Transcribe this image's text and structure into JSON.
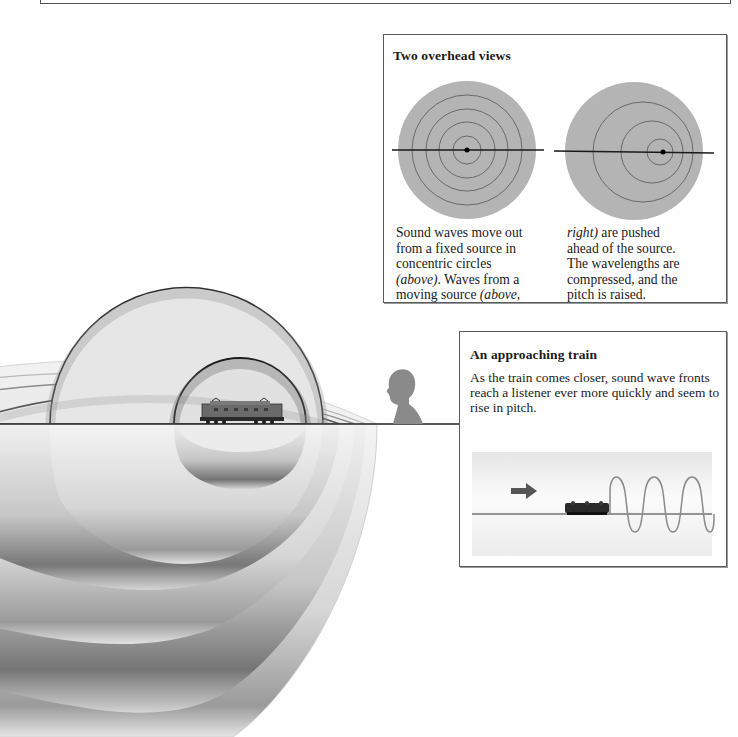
{
  "page": {
    "background": "#ffffff"
  },
  "main_illustration": {
    "description": "Expanding sound wave fronts from a moving train, bunched toward the listener",
    "icons": {
      "train": "locomotive-icon",
      "listener": "person-silhouette-icon"
    },
    "ground_line_y": 424
  },
  "overhead_panel": {
    "title": "Two overhead views",
    "left_caption": {
      "line1": "Sound waves move out",
      "line2": "from a fixed source in",
      "line3": "concentric circles",
      "line4_italic": "(above)",
      "line4_rest": ". Waves from a",
      "line5_rest": "moving source ",
      "line5_italic": "(above,"
    },
    "right_caption": {
      "line1_italic": "right)",
      "line1_rest": " are pushed",
      "line2": "ahead of the source.",
      "line3": "The wavelengths are",
      "line4": "compressed, and the",
      "line5": "pitch is raised."
    },
    "fill_color": "#b4b4b4",
    "ring_color": "#6a6a6a"
  },
  "train_panel": {
    "title": "An approaching train",
    "description": "As the train comes closer, sound wave fronts reach a listener ever more quickly and seem to rise in pitch.",
    "icons": {
      "direction": "arrow-right-icon",
      "train": "locomotive-icon",
      "wave": "sine-wave-icon"
    },
    "arrow_color": "#555555",
    "wave_color": "#8a8a8a"
  }
}
